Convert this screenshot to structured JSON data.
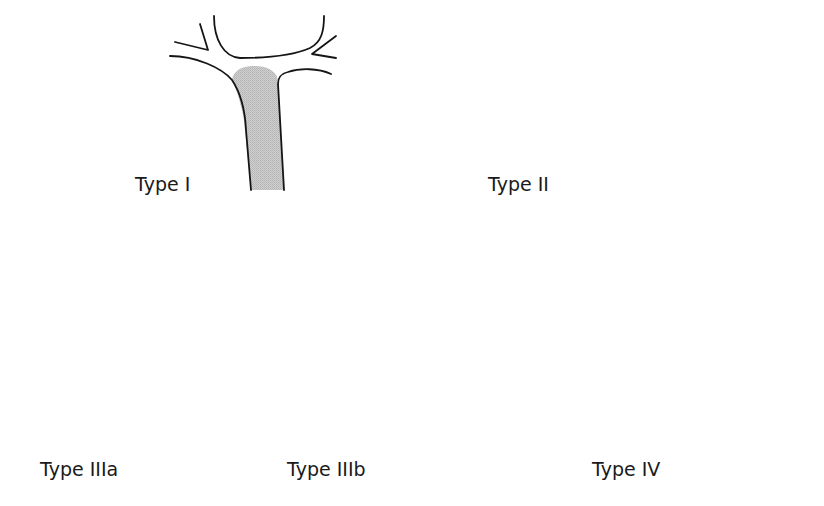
{
  "figure": {
    "fill_color": "#c4c4c4",
    "line_color": "#151515",
    "panels": [
      {
        "id": "type-1",
        "label": "Type I"
      },
      {
        "id": "type-2",
        "label": "Type II"
      },
      {
        "id": "type-3a",
        "label": "Type IIIa"
      },
      {
        "id": "type-3b",
        "label": "Type IIIb"
      },
      {
        "id": "type-4",
        "label": "Type IV"
      }
    ]
  }
}
